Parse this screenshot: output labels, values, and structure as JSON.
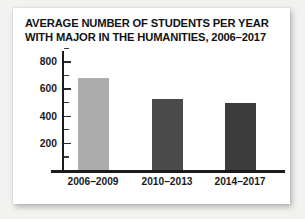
{
  "chart_data": {
    "type": "bar",
    "title": "AVERAGE NUMBER OF STUDENTS PER YEAR WITH MAJOR IN THE HUMANITIES, 2006–2017",
    "title_lines": [
      "AVERAGE NUMBER OF STUDENTS PER YEAR",
      "WITH MAJOR IN THE HUMANITIES, 2006–2017"
    ],
    "categories": [
      "2006–2009",
      "2010–2013",
      "2014–2017"
    ],
    "values": [
      680,
      525,
      495
    ],
    "bar_colors": [
      "#acacac",
      "#4a4a4a",
      "#3c3c3c"
    ],
    "xlabel": "",
    "ylabel": "",
    "ylim": [
      0,
      900
    ],
    "y_ticks_major": [
      200,
      400,
      600,
      800
    ],
    "y_tick_labels": [
      "200",
      "400",
      "600",
      "800"
    ],
    "y_ticks_minor": [
      100,
      300,
      500,
      700,
      900
    ],
    "grid": false,
    "legend": false,
    "background": "#ffffff",
    "axis_color": "#1b1b1b",
    "text_color": "#1a1a1a"
  }
}
